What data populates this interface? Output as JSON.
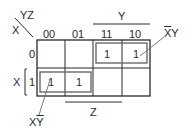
{
  "corner": {
    "col_vars": "YZ",
    "row_var": "X"
  },
  "columns": [
    "00",
    "01",
    "11",
    "10"
  ],
  "rows": [
    "0",
    "1"
  ],
  "cells": [
    [
      "",
      "",
      "1",
      "1"
    ],
    [
      "1",
      "1",
      "",
      ""
    ]
  ],
  "brackets": {
    "top": {
      "label": "Y",
      "span": [
        "11",
        "10"
      ]
    },
    "bottom": {
      "label": "Z",
      "span": [
        "01",
        "11"
      ]
    },
    "left": {
      "label": "X",
      "span": [
        "1"
      ]
    }
  },
  "groups": [
    {
      "term_base": "X",
      "term_overlined": "",
      "term_tail": "Y",
      "display_bar": "X",
      "display_rest": "Y",
      "row": "0",
      "cols": [
        "11",
        "10"
      ]
    },
    {
      "display_first": "X",
      "display_bar": "Y",
      "row": "1",
      "cols": [
        "00",
        "01"
      ]
    }
  ],
  "colors": {
    "line": "#2a2a2a",
    "group": "#6a6a6a",
    "background": "#ffffff"
  }
}
